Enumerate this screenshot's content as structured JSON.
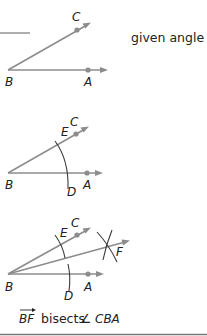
{
  "header_rule": {
    "color": "#9a9a9a"
  },
  "step1": {
    "caption": "given angle",
    "labels": {
      "C": "C",
      "B": "B",
      "A": "A"
    }
  },
  "step2": {
    "labels": {
      "C": "C",
      "E": "E",
      "B": "B",
      "D": "D",
      "A": "A"
    }
  },
  "step3": {
    "labels": {
      "C": "C",
      "E": "E",
      "F": "F",
      "B": "B",
      "D": "D",
      "A": "A"
    },
    "conclusion": {
      "ray": "BF",
      "verb": "bisects",
      "angle_symbol": "∠",
      "angle": "CBA"
    }
  },
  "colors": {
    "ray": "#8c8c8c",
    "arc": "#3a3a3a",
    "text": "#222222",
    "bottom_rule": "#777777"
  }
}
